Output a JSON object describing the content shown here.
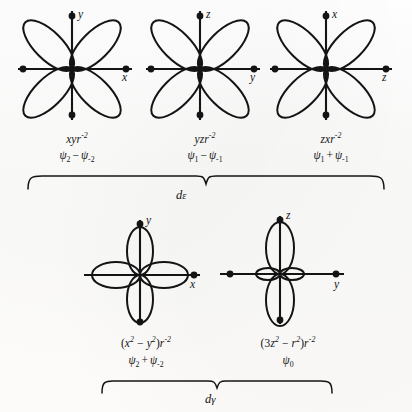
{
  "figure": {
    "background_color": "#fdfdfc",
    "ink_color": "#141414",
    "orbitals": [
      {
        "id": "d-xy",
        "shape": "four-lobe-diagonal",
        "vertical_axis_label": "y",
        "horizontal_axis_label": "x",
        "formula_prefix": "xyr",
        "formula_exponent": "-2",
        "psi_left_sub": "2",
        "psi_operator": "−",
        "psi_right_sub": "-2",
        "group": "dε"
      },
      {
        "id": "d-yz",
        "shape": "four-lobe-diagonal",
        "vertical_axis_label": "z",
        "horizontal_axis_label": "y",
        "formula_prefix": "yzr",
        "formula_exponent": "-2",
        "psi_left_sub": "1",
        "psi_operator": "−",
        "psi_right_sub": "-1",
        "group": "dε"
      },
      {
        "id": "d-zx",
        "shape": "four-lobe-diagonal",
        "vertical_axis_label": "x",
        "horizontal_axis_label": "z",
        "formula_prefix": "zxr",
        "formula_exponent": "-2",
        "psi_left_sub": "1",
        "psi_operator": "+",
        "psi_right_sub": "-1",
        "group": "dε"
      },
      {
        "id": "d-x2-y2",
        "shape": "four-lobe-axial",
        "vertical_axis_label": "y",
        "horizontal_axis_label": "x",
        "formula_open": "(",
        "formula_term1_base": "x",
        "formula_term1_exp": "2",
        "formula_operator": "−",
        "formula_term2_base": "y",
        "formula_term2_exp": "2",
        "formula_close": ")",
        "formula_suffix_base": "r",
        "formula_suffix_exp": "-2",
        "psi_left_sub": "2",
        "psi_operator": "+",
        "psi_right_sub": "-2",
        "group": "dγ"
      },
      {
        "id": "d-z2",
        "shape": "dz2-with-collar",
        "vertical_axis_label": "z",
        "horizontal_axis_label": "y",
        "formula_open": "(",
        "formula_coef": "3",
        "formula_term1_base": "z",
        "formula_term1_exp": "2",
        "formula_operator": "−",
        "formula_term2_base": "r",
        "formula_term2_exp": "2",
        "formula_close": ")",
        "formula_suffix_base": "r",
        "formula_suffix_exp": "-2",
        "psi_only_sub": "0",
        "group": "dγ"
      }
    ],
    "braces": [
      {
        "id": "brace-de",
        "label": "d",
        "label_sub": "ε"
      },
      {
        "id": "brace-dgamma",
        "label": "d",
        "label_sub": "γ"
      }
    ]
  }
}
